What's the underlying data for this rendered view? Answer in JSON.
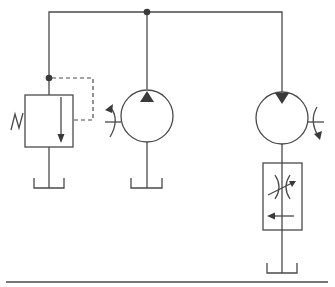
{
  "diagram": {
    "type": "hydraulic-schematic",
    "colors": {
      "line": "#4a4a4a",
      "fill": "#3a3a3a",
      "background": "#ffffff"
    },
    "components": [
      {
        "id": "relief-valve",
        "label": "Pressure relief valve",
        "symbol": "relief-valve-spring-pilot"
      },
      {
        "id": "pump",
        "label": "Hydraulic pump",
        "symbol": "fixed-displacement-pump-rotating-shaft"
      },
      {
        "id": "motor",
        "label": "Hydraulic motor",
        "symbol": "fixed-displacement-motor-rotating-shaft"
      },
      {
        "id": "flow-control",
        "label": "Flow control valve",
        "symbol": "pressure-compensated-flow-control"
      },
      {
        "id": "tank-1",
        "label": "Tank",
        "symbol": "reservoir"
      },
      {
        "id": "tank-2",
        "label": "Tank",
        "symbol": "reservoir"
      },
      {
        "id": "tank-3",
        "label": "Tank",
        "symbol": "reservoir"
      }
    ],
    "connections": [
      {
        "from": "pump",
        "to": "motor",
        "line": "pressure"
      },
      {
        "from": "pump",
        "to": "relief-valve",
        "line": "pressure"
      },
      {
        "from": "pressure-line",
        "to": "relief-valve",
        "line": "pilot-dashed"
      },
      {
        "from": "motor",
        "to": "flow-control",
        "line": "return"
      },
      {
        "from": "flow-control",
        "to": "tank-3",
        "line": "return"
      },
      {
        "from": "relief-valve",
        "to": "tank-1",
        "line": "drain"
      },
      {
        "from": "pump",
        "to": "tank-2",
        "line": "suction"
      }
    ]
  }
}
